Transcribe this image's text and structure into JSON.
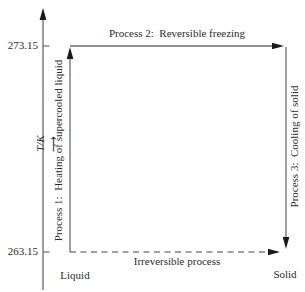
{
  "diagram": {
    "title_semantic": "Reversible and irreversible freezing processes of supercooled liquid",
    "colors": {
      "background": "#ffffff",
      "line": "#6b6b6b",
      "arrowhead": "#1a1a1a",
      "text": "#2b2b2b"
    },
    "y_axis": {
      "label": "T/K",
      "arrow_glyph": "⟶",
      "ticks": [
        {
          "value": "273.15"
        },
        {
          "value": "263.15"
        }
      ]
    },
    "arrows": {
      "process1_label": "Process 1:  Heating of supercooled liquid",
      "process2_label": "Process 2:  Reversible freezing",
      "process3_label": "Process 3:  Cooling of solid",
      "irreversible_label": "Irreversible process"
    },
    "states": {
      "liquid": "Liquid",
      "solid": "Solid"
    }
  }
}
